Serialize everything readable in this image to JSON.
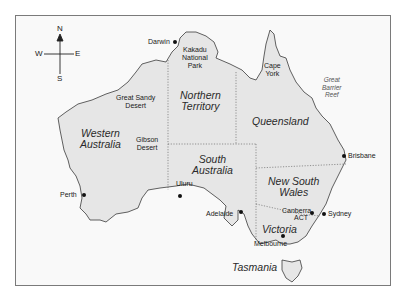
{
  "compass": {
    "n": "N",
    "s": "S",
    "e": "E",
    "w": "W"
  },
  "states": {
    "wa_line1": "Western",
    "wa_line2": "Australia",
    "nt_line1": "Northern",
    "nt_line2": "Territory",
    "qld": "Queensland",
    "sa_line1": "South",
    "sa_line2": "Australia",
    "nsw_line1": "New South",
    "nsw_line2": "Wales",
    "vic": "Victoria",
    "tas": "Tasmania"
  },
  "places": {
    "darwin": "Darwin",
    "kakadu_1": "Kakadu",
    "kakadu_2": "National",
    "kakadu_3": "Park",
    "cape_1": "Cape",
    "cape_2": "York",
    "gsd_1": "Great Sandy",
    "gsd_2": "Desert",
    "gibson_1": "Gibson",
    "gibson_2": "Desert",
    "uluru": "Uluru",
    "brisbane": "Brisbane",
    "perth": "Perth",
    "adelaide": "Adelaide",
    "canberra": "Canberra",
    "act": "ACT",
    "sydney": "Sydney",
    "melbourne": "Melbourne"
  },
  "reef": {
    "l1": "Great",
    "l2": "Barrier",
    "l3": "Reef"
  },
  "colors": {
    "land": "#e6e6e6",
    "coast": "#3a3a3a",
    "border": "#555555",
    "frame": "#7a7a7a"
  }
}
